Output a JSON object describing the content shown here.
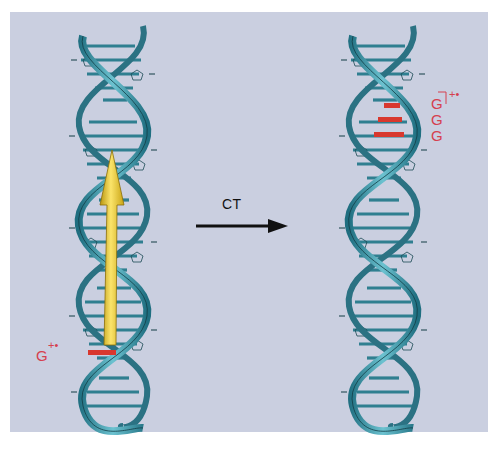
{
  "figure": {
    "background_color": "#cacfe0",
    "helix_color": "#3f98a8",
    "hole_color": "#f2cd3a",
    "radical_color": "#d6404e"
  },
  "left_helix": {
    "label_base": "G",
    "label_charge": "+•",
    "hole_arrow": "yellow-arrow (hole transfer direction)",
    "oxidized_base_pairs": 1
  },
  "transition": {
    "label": "CT"
  },
  "right_helix": {
    "labels": [
      "G",
      "G",
      "G"
    ],
    "label_charge": "+•",
    "oxidized_base_pairs": 3
  }
}
